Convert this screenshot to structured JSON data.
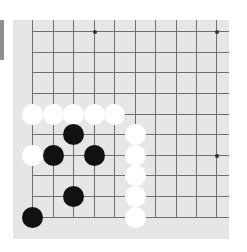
{
  "board": {
    "background": "#e6e6e6",
    "line_color": "#6f6f6f",
    "columns_x": [
      32,
      53,
      73,
      94,
      114,
      135,
      155,
      176,
      196,
      216
    ],
    "rows_y": [
      31,
      52,
      72,
      93,
      114,
      134,
      155,
      175,
      196,
      217
    ],
    "star_points": [
      [
        3,
        0
      ],
      [
        9,
        0
      ],
      [
        9,
        6
      ],
      [
        3,
        6
      ]
    ]
  },
  "stones": [
    {
      "color": "white",
      "col": 0,
      "row": 4
    },
    {
      "color": "white",
      "col": 1,
      "row": 4
    },
    {
      "color": "white",
      "col": 2,
      "row": 4
    },
    {
      "color": "white",
      "col": 3,
      "row": 4
    },
    {
      "color": "white",
      "col": 4,
      "row": 4
    },
    {
      "color": "black",
      "col": 2,
      "row": 5
    },
    {
      "color": "white",
      "col": 5,
      "row": 5
    },
    {
      "color": "white",
      "col": 0,
      "row": 6
    },
    {
      "color": "black",
      "col": 1,
      "row": 6
    },
    {
      "color": "black",
      "col": 3,
      "row": 6
    },
    {
      "color": "white",
      "col": 5,
      "row": 6
    },
    {
      "color": "white",
      "col": 5,
      "row": 7
    },
    {
      "color": "black",
      "col": 2,
      "row": 8
    },
    {
      "color": "white",
      "col": 5,
      "row": 8
    },
    {
      "color": "black",
      "col": 0,
      "row": 9
    },
    {
      "color": "white",
      "col": 5,
      "row": 9
    }
  ]
}
